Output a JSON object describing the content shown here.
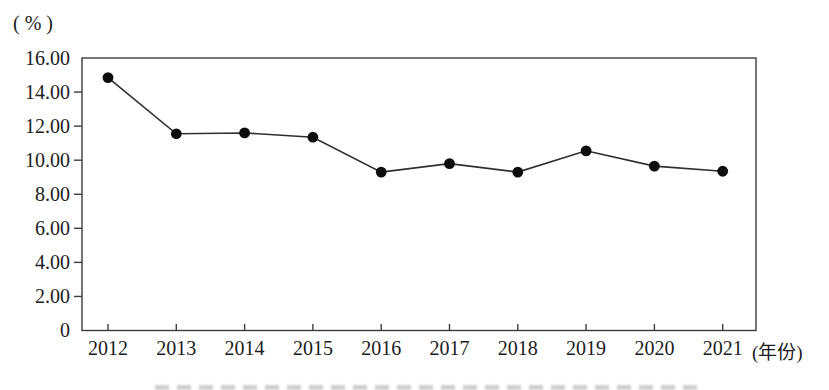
{
  "page": {
    "background": "#ffffff"
  },
  "chart": {
    "y_unit_label": "( % )",
    "x_unit_label": "(年份)"
  },
  "chart_data": {
    "type": "line",
    "title": "",
    "categories": [
      "2012",
      "2013",
      "2014",
      "2015",
      "2016",
      "2017",
      "2018",
      "2019",
      "2020",
      "2021"
    ],
    "series": [
      {
        "name": "",
        "values": [
          14.85,
          11.55,
          11.6,
          11.35,
          9.3,
          9.8,
          9.3,
          10.55,
          9.65,
          9.35
        ]
      }
    ],
    "xlabel": "(年份)",
    "ylabel": "( % )",
    "ylim": [
      0,
      16
    ],
    "ytick_step": 2,
    "ytick_labels": [
      "0",
      "2.00",
      "4.00",
      "6.00",
      "8.00",
      "10.00",
      "12.00",
      "14.00",
      "16.00"
    ],
    "grid": false,
    "legend": "none",
    "marker": "filled-circle",
    "colors": {
      "line": "#2f2f2f",
      "marker": "#0d0d0d",
      "axis": "#3c3c3c",
      "text": "#1c1c1c"
    }
  }
}
